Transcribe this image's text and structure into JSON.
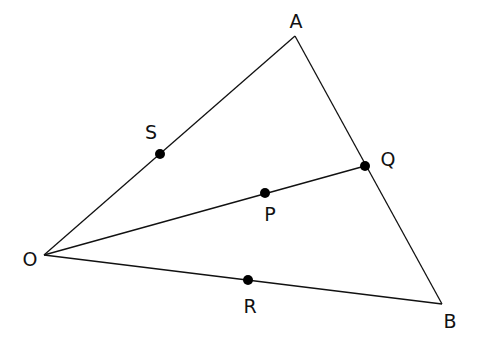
{
  "diagram": {
    "type": "geometry-triangle",
    "vertices": {
      "O": {
        "label": "O",
        "x": 44,
        "y": 255,
        "lx": 30,
        "ly": 266
      },
      "A": {
        "label": "A",
        "x": 295,
        "y": 36,
        "lx": 296,
        "ly": 28
      },
      "B": {
        "label": "B",
        "x": 442,
        "y": 304,
        "lx": 450,
        "ly": 328
      }
    },
    "points": {
      "S": {
        "label": "S",
        "x": 160,
        "y": 154,
        "lx": 151,
        "ly": 139
      },
      "Q": {
        "label": "Q",
        "x": 365,
        "y": 166,
        "lx": 388,
        "ly": 166
      },
      "P": {
        "label": "P",
        "x": 265,
        "y": 193,
        "lx": 270,
        "ly": 221
      },
      "R": {
        "label": "R",
        "x": 248,
        "y": 280,
        "lx": 250,
        "ly": 313
      }
    },
    "segments": [
      [
        "O",
        "A"
      ],
      [
        "A",
        "B"
      ],
      [
        "O",
        "B"
      ],
      [
        "O",
        "Q"
      ]
    ],
    "line_color": "#111111",
    "point_color": "#000000"
  }
}
